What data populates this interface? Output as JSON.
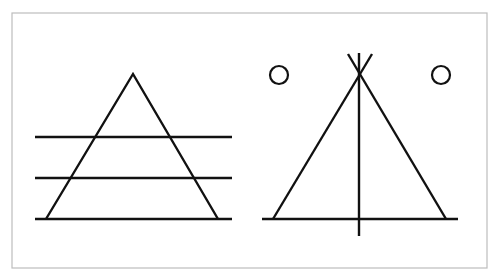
{
  "diagram": {
    "frame": {
      "x": 12,
      "y": 13,
      "width": 475,
      "height": 255,
      "border_color": "#bdbdbd",
      "background": "#ffffff"
    },
    "ink_color": "#111111",
    "figures": [
      {
        "name": "triangle-with-horizontal-lines",
        "triangle": {
          "apex": [
            133,
            74
          ],
          "base_left": [
            46,
            219
          ],
          "base_right": [
            218,
            219
          ]
        },
        "horizontal_lines": [
          {
            "x1": 35,
            "x2": 232,
            "y": 137
          },
          {
            "x1": 35,
            "x2": 232,
            "y": 178
          },
          {
            "x1": 35,
            "x2": 232,
            "y": 219
          }
        ]
      },
      {
        "name": "teepee-with-circles",
        "legs": [
          {
            "from": [
              273,
              219
            ],
            "to": [
              372,
              54
            ]
          },
          {
            "from": [
              446,
              219
            ],
            "to": [
              348,
              54
            ]
          }
        ],
        "vertical_pole": {
          "x": 359,
          "y1": 53,
          "y2": 236
        },
        "base_line": {
          "x1": 262,
          "x2": 458,
          "y": 219
        },
        "circles": [
          {
            "cx": 279,
            "cy": 75,
            "r": 9
          },
          {
            "cx": 441,
            "cy": 75,
            "r": 9
          }
        ]
      }
    ]
  }
}
